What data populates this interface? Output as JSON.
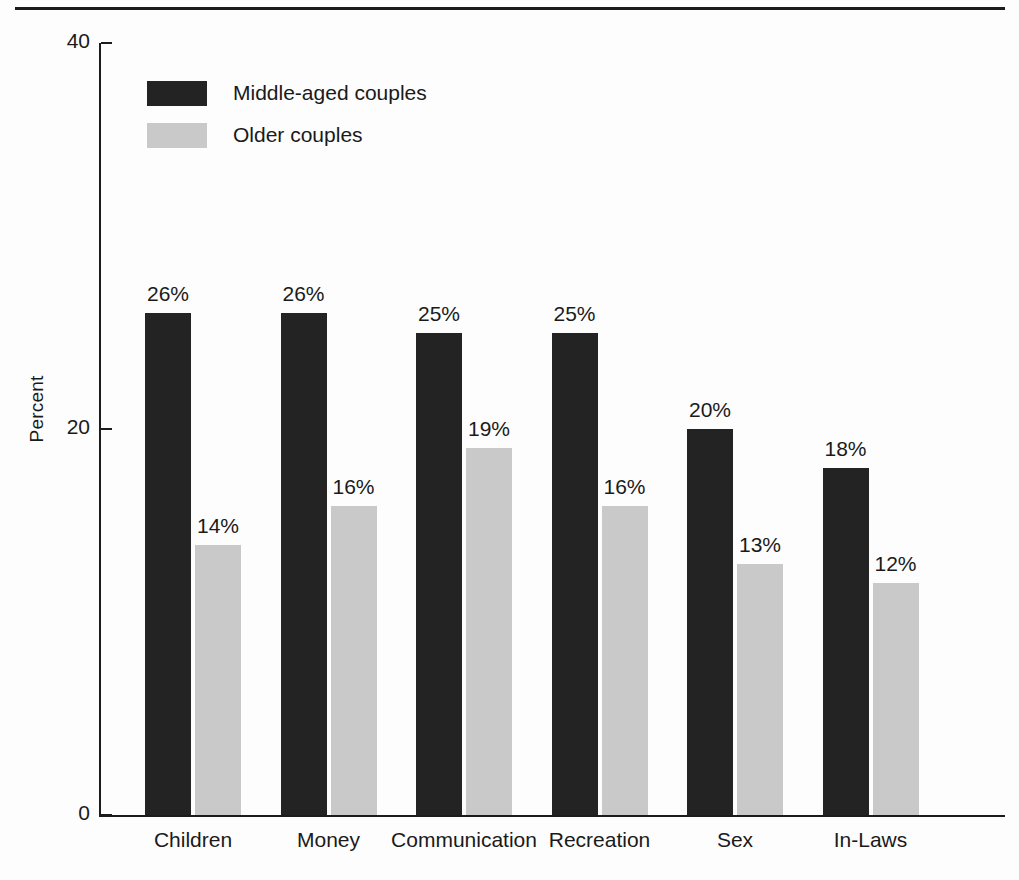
{
  "chart_data": {
    "type": "bar",
    "title": "",
    "xlabel": "",
    "ylabel": "Percent",
    "ylim": [
      0,
      40
    ],
    "yticks": [
      "0",
      "20",
      "40"
    ],
    "grid": false,
    "legend_position": "top-left",
    "categories": [
      "Children",
      "Money",
      "Communication",
      "Recreation",
      "Sex",
      "In-Laws"
    ],
    "series": [
      {
        "name": "Middle-aged couples",
        "color": "#232323",
        "values": [
          26,
          26,
          25,
          25,
          20,
          18
        ],
        "labels": [
          "26%",
          "26%",
          "25%",
          "25%",
          "20%",
          "18%"
        ]
      },
      {
        "name": "Older couples",
        "color": "#c9c9c9",
        "values": [
          14,
          16,
          19,
          16,
          13,
          12
        ],
        "labels": [
          "14%",
          "16%",
          "19%",
          "16%",
          "13%",
          "12%"
        ]
      }
    ]
  },
  "axis": {
    "y_title": "Percent",
    "ticks": [
      {
        "label": "40",
        "value": 40
      },
      {
        "label": "20",
        "value": 20
      },
      {
        "label": "0",
        "value": 0
      }
    ]
  },
  "legend": {
    "items": [
      {
        "label": "Middle-aged couples",
        "color": "#232323"
      },
      {
        "label": "Older couples",
        "color": "#c9c9c9"
      }
    ]
  }
}
